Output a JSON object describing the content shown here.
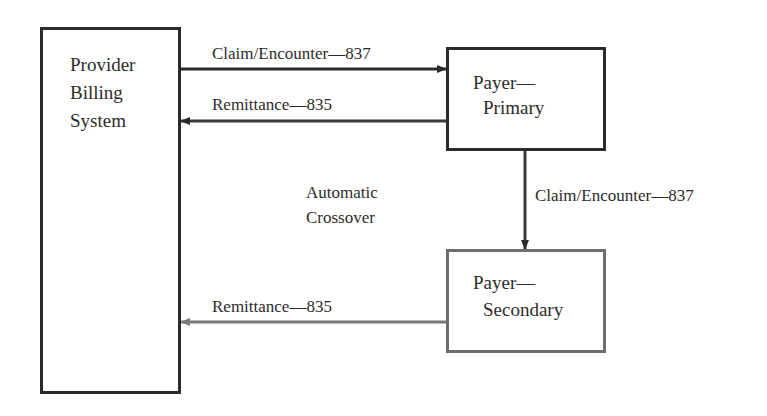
{
  "diagram": {
    "nodes": {
      "provider": {
        "line1": "Provider",
        "line2": "Billing",
        "line3": "System"
      },
      "primary": {
        "line1": "Payer—",
        "line2": "Primary"
      },
      "secondary": {
        "line1": "Payer—",
        "line2": "Secondary"
      }
    },
    "edges": {
      "provider_to_primary": {
        "label": "Claim/Encounter—837"
      },
      "primary_to_provider": {
        "label": "Remittance—835"
      },
      "primary_to_secondary": {
        "label": "Claim/Encounter—837"
      },
      "secondary_to_provider": {
        "label": "Remittance—835"
      }
    },
    "annotation": {
      "line1": "Automatic",
      "line2": "Crossover"
    },
    "colors": {
      "dark": "#2b2b2b",
      "grey": "#6e6e6e"
    }
  }
}
